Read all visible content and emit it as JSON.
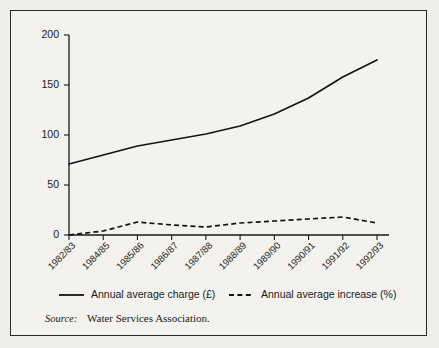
{
  "chart_data": {
    "type": "line",
    "title": "",
    "xlabel": "",
    "ylabel": "",
    "ylim": [
      0,
      200
    ],
    "yticks": [
      0,
      50,
      100,
      150,
      200
    ],
    "grid": false,
    "legend_position": "bottom",
    "categories": [
      "1982/83",
      "1984/85",
      "1985/86",
      "1986/87",
      "1987/88",
      "1988/89",
      "1989/90",
      "1990/91",
      "1991/92",
      "1992/93"
    ],
    "series": [
      {
        "name": "Annual average charge (£)",
        "style": "solid",
        "values": [
          71,
          80,
          89,
          95,
          101,
          109,
          121,
          137,
          158,
          175
        ]
      },
      {
        "name": "Annual average increase (%)",
        "style": "dashed",
        "values": [
          0,
          4,
          13,
          10,
          8,
          12,
          14,
          16,
          18,
          12
        ]
      }
    ]
  },
  "legend": {
    "items": [
      {
        "label": "Annual average charge (£)",
        "style": "solid"
      },
      {
        "label": "Annual average increase (%)",
        "style": "dashed"
      }
    ]
  },
  "source": {
    "word": "Source:",
    "text": "Water Services Association."
  },
  "colors": {
    "ink": "#141414",
    "page": "#efeeea",
    "panel": "#f3f2ef",
    "border": "#2b2b2b"
  }
}
